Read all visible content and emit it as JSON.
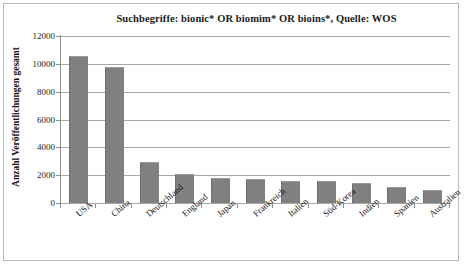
{
  "chart_data": {
    "type": "bar",
    "title": "Suchbegriffe: bionic* OR biomim* OR bioins*, Quelle: WOS",
    "xlabel": "",
    "ylabel": "Anzahl Veröffentlichungen gesamt",
    "ylim": [
      0,
      12000
    ],
    "yticks": [
      12000,
      10000,
      8000,
      6000,
      4000,
      2000,
      0
    ],
    "ytick_labels": [
      "12000",
      "10000",
      "8000",
      "6000",
      "4000",
      "2000",
      "0"
    ],
    "grid": true,
    "legend": false,
    "bar_color": "#808080",
    "categories": [
      "USA",
      "China",
      "Deutschland",
      "England",
      "Japan",
      "Frankreich",
      "Italien",
      "Süd-Korea",
      "Indien",
      "Spanien",
      "Australien"
    ],
    "values": [
      10550,
      9800,
      2950,
      2100,
      1800,
      1750,
      1600,
      1550,
      1450,
      1150,
      950
    ]
  }
}
